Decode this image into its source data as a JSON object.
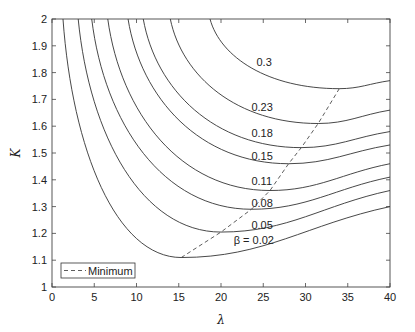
{
  "chart_data": {
    "type": "line",
    "title": "",
    "xlabel": "λ",
    "ylabel": "K",
    "xlim": [
      0,
      40
    ],
    "ylim": [
      1,
      2
    ],
    "xticks": [
      0,
      5,
      10,
      15,
      20,
      25,
      30,
      35,
      40
    ],
    "yticks": [
      1,
      1.1,
      1.2,
      1.3,
      1.4,
      1.5,
      1.6,
      1.7,
      1.8,
      1.9,
      2
    ],
    "grid": false,
    "legend": {
      "position": "lower left",
      "entries": [
        {
          "label": "Minimum",
          "style": "dashed"
        }
      ]
    },
    "series": [
      {
        "name": "β = 0.02",
        "label": "β = 0.02",
        "top_lambda": 1.3,
        "min": [
          15.3,
          1.11
        ],
        "end": [
          40,
          1.3
        ],
        "label_pos": [
          21.5,
          1.175
        ]
      },
      {
        "name": "0.05",
        "label": "0.05",
        "top_lambda": 3.1,
        "min": [
          20.0,
          1.205
        ],
        "end": [
          40,
          1.36
        ],
        "label_pos": [
          23.6,
          1.23
        ]
      },
      {
        "name": "0.08",
        "label": "0.08",
        "top_lambda": 4.7,
        "min": [
          23.6,
          1.29
        ],
        "end": [
          40,
          1.41
        ],
        "label_pos": [
          23.6,
          1.315
        ]
      },
      {
        "name": "0.11",
        "label": "0.11",
        "top_lambda": 6.6,
        "min": [
          25.8,
          1.36
        ],
        "end": [
          40,
          1.46
        ],
        "label_pos": [
          23.6,
          1.395
        ]
      },
      {
        "name": "0.15",
        "label": "0.15",
        "top_lambda": 9.0,
        "min": [
          28.0,
          1.46
        ],
        "end": [
          40,
          1.53
        ],
        "label_pos": [
          23.6,
          1.49
        ]
      },
      {
        "name": "0.18",
        "label": "0.18",
        "top_lambda": 10.8,
        "min": [
          29.5,
          1.52
        ],
        "end": [
          40,
          1.58
        ],
        "label_pos": [
          23.6,
          1.575
        ]
      },
      {
        "name": "0.23",
        "label": "0.23",
        "top_lambda": 14.0,
        "min": [
          31.5,
          1.61
        ],
        "end": [
          40,
          1.66
        ],
        "label_pos": [
          23.6,
          1.67
        ]
      },
      {
        "name": "0.3",
        "label": "0.3",
        "top_lambda": 18.7,
        "min": [
          34.0,
          1.74
        ],
        "end": [
          40,
          1.77
        ],
        "label_pos": [
          24.2,
          1.84
        ]
      }
    ],
    "minimum_line": {
      "name": "Minimum",
      "points": [
        [
          15.3,
          1.11
        ],
        [
          20.0,
          1.205
        ],
        [
          23.6,
          1.29
        ],
        [
          25.8,
          1.36
        ],
        [
          28.0,
          1.46
        ],
        [
          29.5,
          1.52
        ],
        [
          31.5,
          1.61
        ],
        [
          34.0,
          1.74
        ]
      ]
    }
  },
  "axes": {
    "xlabel": "λ",
    "ylabel": "K",
    "legend_label": "Minimum"
  }
}
